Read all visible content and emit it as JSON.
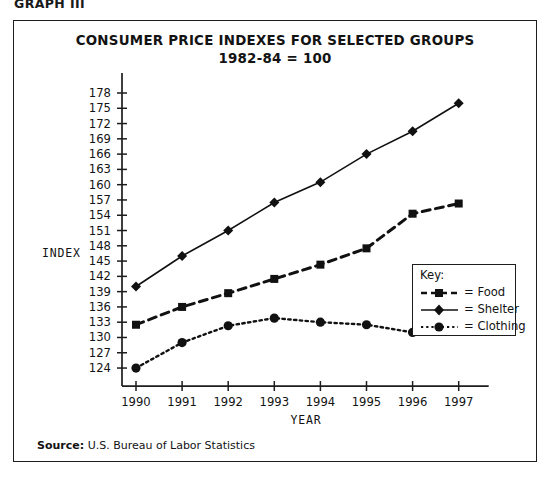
{
  "figure_label": "GRAPH III",
  "title": {
    "line1": "CONSUMER PRICE INDEXES FOR SELECTED GROUPS",
    "line2": "1982-84 = 100"
  },
  "axes": {
    "y_label": "INDEX",
    "x_label": "YEAR"
  },
  "legend": {
    "heading": "Key:",
    "entries": [
      {
        "label": "= Food",
        "style": "dashed",
        "marker": "square"
      },
      {
        "label": "= Shelter",
        "style": "solid",
        "marker": "diamond"
      },
      {
        "label": "= Clothing",
        "style": "dotted",
        "marker": "circle"
      }
    ]
  },
  "source": {
    "prefix": "Source:",
    "text": "U.S. Bureau of Labor Statistics"
  },
  "chart_data": {
    "type": "line",
    "xlabel": "YEAR",
    "ylabel": "INDEX",
    "categories": [
      1990,
      1991,
      1992,
      1993,
      1994,
      1995,
      1996,
      1997
    ],
    "x_tick_labels": [
      "1990",
      "1991",
      "1992",
      "1993",
      "1994",
      "1995",
      "1996",
      "1997"
    ],
    "y_tick_labels": [
      "124",
      "127",
      "130",
      "133",
      "136",
      "139",
      "142",
      "145",
      "148",
      "151",
      "154",
      "157",
      "160",
      "163",
      "166",
      "169",
      "172",
      "175",
      "178"
    ],
    "ylim": [
      124,
      178
    ],
    "y_tick_step": 3,
    "grid": false,
    "legend_position": "inside-right",
    "series": [
      {
        "name": "Food",
        "style": "dashed",
        "marker": "square",
        "color": "#111111",
        "values": [
          132.5,
          136.0,
          138.7,
          141.5,
          144.3,
          147.5,
          154.3,
          156.3
        ]
      },
      {
        "name": "Shelter",
        "style": "solid",
        "marker": "diamond",
        "color": "#111111",
        "values": [
          140.0,
          146.0,
          151.0,
          156.5,
          160.5,
          166.0,
          170.5,
          176.0
        ]
      },
      {
        "name": "Clothing",
        "style": "dotted",
        "marker": "circle",
        "color": "#111111",
        "values": [
          124.0,
          129.0,
          132.3,
          133.8,
          133.0,
          132.5,
          131.0,
          133.0
        ]
      }
    ]
  }
}
